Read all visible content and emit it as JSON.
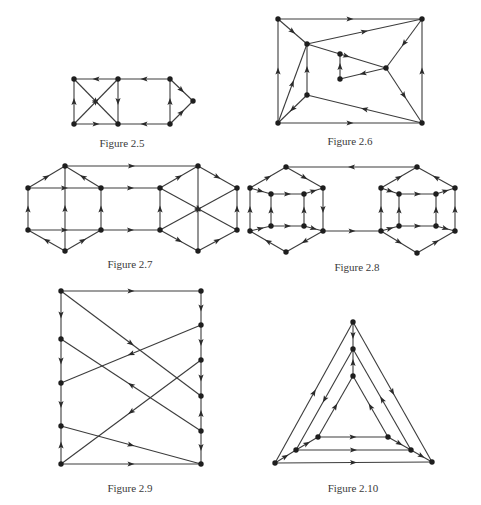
{
  "page": {
    "background": "#ffffff",
    "ink": "#2a2a2a"
  },
  "figures": [
    {
      "id": "fig-2-5",
      "caption": "Figure 2.5",
      "caption_pos": [
        122,
        137
      ],
      "nodes": {
        "a": [
          74,
          79
        ],
        "b": [
          118,
          79
        ],
        "c": [
          170,
          79
        ],
        "d": [
          193,
          101
        ],
        "e": [
          74,
          124
        ],
        "f": [
          118,
          124
        ],
        "g": [
          170,
          124
        ]
      },
      "edges": [
        [
          "b",
          "a",
          true
        ],
        [
          "c",
          "b",
          true
        ],
        [
          "c",
          "d",
          true
        ],
        [
          "g",
          "d",
          true
        ],
        [
          "e",
          "a",
          true
        ],
        [
          "b",
          "f",
          true
        ],
        [
          "g",
          "c",
          true
        ],
        [
          "e",
          "f",
          true
        ],
        [
          "g",
          "f",
          true
        ],
        [
          "a",
          "f",
          true
        ],
        [
          "e",
          "b",
          true
        ]
      ]
    },
    {
      "id": "fig-2-6",
      "caption": "Figure 2.6",
      "caption_pos": [
        350,
        135
      ],
      "nodes": {
        "tl": [
          278,
          19
        ],
        "tr": [
          422,
          19
        ],
        "a": [
          307,
          44
        ],
        "b": [
          340,
          54
        ],
        "c": [
          386,
          68
        ],
        "d": [
          340,
          79
        ],
        "e": [
          307,
          95
        ],
        "bl": [
          278,
          123
        ],
        "br": [
          422,
          123
        ]
      },
      "edges": [
        [
          "tl",
          "tr",
          true
        ],
        [
          "a",
          "tr",
          true
        ],
        [
          "tl",
          "a",
          true
        ],
        [
          "tr",
          "c",
          true
        ],
        [
          "a",
          "c",
          true
        ],
        [
          "d",
          "b",
          true
        ],
        [
          "c",
          "d",
          true
        ],
        [
          "c",
          "br",
          true
        ],
        [
          "bl",
          "tl",
          true
        ],
        [
          "br",
          "tr",
          true
        ],
        [
          "bl",
          "a",
          true
        ],
        [
          "e",
          "a",
          true
        ],
        [
          "e",
          "bl",
          true
        ],
        [
          "br",
          "e",
          true
        ],
        [
          "bl",
          "br",
          true
        ]
      ]
    },
    {
      "id": "fig-2-7",
      "caption": "Figure 2.7",
      "caption_pos": [
        130,
        258
      ],
      "nodes": {
        "lt": [
          65,
          166
        ],
        "lul": [
          28,
          188
        ],
        "lur": [
          101,
          188
        ],
        "lll": [
          28,
          230
        ],
        "llr": [
          101,
          230
        ],
        "lb": [
          65,
          251
        ],
        "rt": [
          198,
          166
        ],
        "rul": [
          160,
          188
        ],
        "rur": [
          237,
          188
        ],
        "rll": [
          160,
          230
        ],
        "rlr": [
          237,
          230
        ],
        "rb": [
          198,
          251
        ]
      },
      "edges": [
        [
          "lul",
          "lt",
          true
        ],
        [
          "lur",
          "lt",
          true
        ],
        [
          "lt",
          "rt",
          true
        ],
        [
          "lul",
          "lur",
          true
        ],
        [
          "lur",
          "rul",
          true
        ],
        [
          "lll",
          "lul",
          true
        ],
        [
          "llr",
          "lur",
          true
        ],
        [
          "lb",
          "lt",
          true
        ],
        [
          "lll",
          "llr",
          true
        ],
        [
          "llr",
          "rll",
          true
        ],
        [
          "lb",
          "lll",
          true
        ],
        [
          "lb",
          "llr",
          true
        ],
        [
          "rul",
          "rt",
          true
        ],
        [
          "rt",
          "rur",
          true
        ],
        [
          "rll",
          "rul",
          true
        ],
        [
          "rlr",
          "rur",
          true
        ],
        [
          "rb",
          "rt",
          true
        ],
        [
          "rul",
          "rlr",
          true
        ],
        [
          "rll",
          "rur",
          true
        ],
        [
          "rll",
          "rb",
          true
        ],
        [
          "rb",
          "rlr",
          true
        ]
      ]
    },
    {
      "id": "fig-2-8",
      "caption": "Figure 2.8",
      "caption_pos": [
        357,
        261
      ],
      "nodes": {
        "lt": [
          286,
          167
        ],
        "lou": [
          250,
          188
        ],
        "liu": [
          271,
          194
        ],
        "lju": [
          304,
          194
        ],
        "lpu": [
          323,
          188
        ],
        "lol": [
          250,
          231
        ],
        "lil": [
          271,
          226
        ],
        "ljl": [
          304,
          226
        ],
        "lpl": [
          323,
          231
        ],
        "lb": [
          286,
          252
        ],
        "rt": [
          417,
          167
        ],
        "rou": [
          381,
          188
        ],
        "riu": [
          399,
          194
        ],
        "rju": [
          436,
          194
        ],
        "rpu": [
          455,
          188
        ],
        "rol": [
          381,
          231
        ],
        "ril": [
          399,
          226
        ],
        "rjl": [
          436,
          226
        ],
        "rpl": [
          455,
          231
        ],
        "rb": [
          417,
          253
        ]
      },
      "edges": [
        [
          "rt",
          "lt",
          true
        ],
        [
          "lou",
          "lt",
          true
        ],
        [
          "lt",
          "lpu",
          true
        ],
        [
          "lou",
          "liu",
          true
        ],
        [
          "liu",
          "lju",
          true
        ],
        [
          "lju",
          "lpu",
          true
        ],
        [
          "lol",
          "lou",
          true
        ],
        [
          "lil",
          "liu",
          true
        ],
        [
          "ljl",
          "lju",
          true
        ],
        [
          "lpu",
          "lpl",
          true
        ],
        [
          "lol",
          "lil",
          true
        ],
        [
          "lil",
          "ljl",
          true
        ],
        [
          "ljl",
          "lpl",
          true
        ],
        [
          "lb",
          "lol",
          true
        ],
        [
          "lpl",
          "lb",
          true
        ],
        [
          "lpl",
          "rol",
          true
        ],
        [
          "rou",
          "rt",
          true
        ],
        [
          "rpu",
          "rt",
          true
        ],
        [
          "rou",
          "riu",
          true
        ],
        [
          "riu",
          "rju",
          true
        ],
        [
          "rju",
          "rpu",
          true
        ],
        [
          "rol",
          "rou",
          true
        ],
        [
          "ril",
          "riu",
          true
        ],
        [
          "rjl",
          "rju",
          true
        ],
        [
          "rpl",
          "rpu",
          true
        ],
        [
          "rol",
          "ril",
          true
        ],
        [
          "ril",
          "rjl",
          true
        ],
        [
          "rjl",
          "rpl",
          true
        ],
        [
          "rol",
          "rb",
          true
        ],
        [
          "rb",
          "rpl",
          true
        ]
      ]
    },
    {
      "id": "fig-2-9",
      "caption": "Figure 2.9",
      "caption_pos": [
        130,
        482
      ],
      "nodes": {
        "l1": [
          61,
          291
        ],
        "l2": [
          61,
          339
        ],
        "l3": [
          61,
          383
        ],
        "l4": [
          61,
          426
        ],
        "l5": [
          61,
          464
        ],
        "r1": [
          201,
          291
        ],
        "r2": [
          201,
          325
        ],
        "r3": [
          201,
          360
        ],
        "r4": [
          201,
          396
        ],
        "r5": [
          201,
          431
        ],
        "r6": [
          201,
          464
        ]
      },
      "edges": [
        [
          "l1",
          "r1",
          true
        ],
        [
          "l1",
          "l2",
          true
        ],
        [
          "l2",
          "l3",
          true
        ],
        [
          "l3",
          "l4",
          true
        ],
        [
          "l5",
          "l4",
          true
        ],
        [
          "r1",
          "r2",
          true
        ],
        [
          "r2",
          "r3",
          true
        ],
        [
          "r3",
          "r4",
          true
        ],
        [
          "r5",
          "r4",
          true
        ],
        [
          "r5",
          "r6",
          true
        ],
        [
          "l1",
          "r4",
          true
        ],
        [
          "r2",
          "l3",
          true
        ],
        [
          "r5",
          "l2",
          true
        ],
        [
          "r3",
          "l5",
          true
        ],
        [
          "l4",
          "r6",
          true
        ],
        [
          "l5",
          "r6",
          true
        ]
      ]
    },
    {
      "id": "fig-2-10",
      "caption": "Figure 2.10",
      "caption_pos": [
        353,
        482
      ],
      "nodes": {
        "ot": [
          353,
          322
        ],
        "obl": [
          275,
          463
        ],
        "obr": [
          432,
          462
        ],
        "mt": [
          353,
          349
        ],
        "mbl": [
          296,
          450
        ],
        "mbr": [
          411,
          450
        ],
        "it": [
          353,
          376
        ],
        "ibl": [
          318,
          437
        ],
        "ibr": [
          388,
          437
        ]
      },
      "edges": [
        [
          "obl",
          "ot",
          true
        ],
        [
          "ot",
          "obr",
          true
        ],
        [
          "obl",
          "obr",
          true
        ],
        [
          "mt",
          "mbl",
          true
        ],
        [
          "mbr",
          "mt",
          true
        ],
        [
          "mbl",
          "mbr",
          true
        ],
        [
          "ibl",
          "it",
          true
        ],
        [
          "ibr",
          "it",
          true
        ],
        [
          "ibl",
          "ibr",
          true
        ],
        [
          "ot",
          "mt",
          true
        ],
        [
          "it",
          "mt",
          true
        ],
        [
          "obl",
          "mbl",
          true
        ],
        [
          "mbl",
          "ibl",
          true
        ],
        [
          "ibr",
          "mbr",
          true
        ],
        [
          "mbr",
          "obr",
          true
        ]
      ]
    }
  ]
}
